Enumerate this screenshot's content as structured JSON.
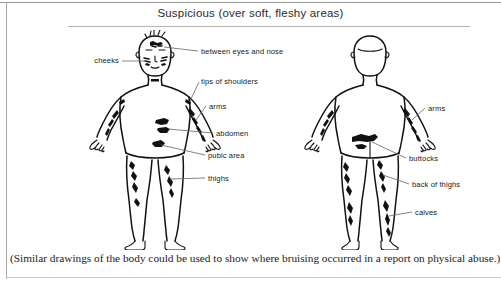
{
  "header": {
    "title": "Suspicious (over soft, fleshy areas)"
  },
  "caption": {
    "text": "(Similar drawings of the body could be used to show where bruising occurred in a report on physical abuse.)"
  },
  "diagram": {
    "type": "body-map",
    "figures": [
      {
        "id": "front-figure",
        "view": "front",
        "labels": [
          {
            "id": "cheeks",
            "text": "cheeks",
            "side": "left"
          },
          {
            "id": "between-eyes-and-nose",
            "text": "between eyes and nose",
            "side": "right"
          },
          {
            "id": "tips-of-shoulders",
            "text": "tips of shoulders",
            "side": "right"
          },
          {
            "id": "arms",
            "text": "arms",
            "side": "right"
          },
          {
            "id": "abdomen",
            "text": "abdomen",
            "side": "right"
          },
          {
            "id": "pubic-area",
            "text": "pubic area",
            "side": "right"
          },
          {
            "id": "thighs",
            "text": "thighs",
            "side": "right"
          }
        ]
      },
      {
        "id": "back-figure",
        "view": "back",
        "labels": [
          {
            "id": "arms",
            "text": "arms",
            "side": "right"
          },
          {
            "id": "buttocks",
            "text": "buttocks",
            "side": "right"
          },
          {
            "id": "back-of-thighs",
            "text": "back of thighs",
            "side": "right"
          },
          {
            "id": "calves",
            "text": "calves",
            "side": "right"
          }
        ]
      }
    ]
  },
  "colors": {
    "ink": "#111111",
    "leader": "#6d6d6d",
    "rule": "#b4b4b4",
    "text": "#1a1a1a"
  }
}
